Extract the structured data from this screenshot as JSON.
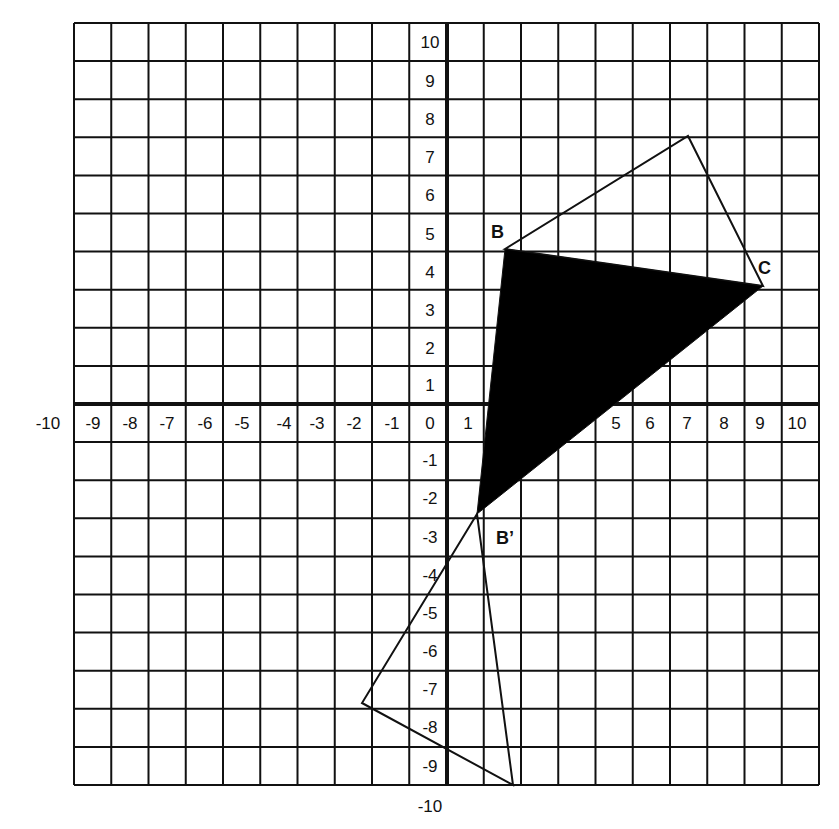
{
  "figure": {
    "type": "coordinate-grid-transformation",
    "background": "#ffffff",
    "line_color": "#111111",
    "fill_color": "#000000"
  },
  "grid": {
    "left_px": 74,
    "top_px": 23,
    "right_px": 819,
    "bottom_px": 785,
    "columns": 20,
    "rows": 20,
    "y_axis_px": 447,
    "x_axis_px": 404
  },
  "x_axis": {
    "ticks": [
      "-10",
      "-9",
      "-8",
      "-7",
      "-6",
      "-5",
      "-4",
      "-3",
      "-2",
      "-1",
      "0",
      "1",
      "5",
      "6",
      "7",
      "8",
      "9",
      "10"
    ],
    "tick_positions_px": [
      48,
      93,
      130,
      167,
      205,
      242,
      284,
      317,
      354,
      392,
      430,
      468,
      616,
      650,
      687,
      724,
      760,
      797
    ]
  },
  "y_axis": {
    "ticks": [
      "10",
      "9",
      "8",
      "7",
      "6",
      "5",
      "4",
      "3",
      "2",
      "1",
      "-1",
      "-2",
      "-3",
      "-4",
      "-5",
      "-6",
      "-7",
      "-8",
      "-9",
      "-10"
    ],
    "tick_positions_px": [
      42,
      81,
      119,
      157,
      195,
      234,
      272,
      310,
      348,
      385,
      460,
      498,
      537,
      575,
      613,
      651,
      689,
      727,
      766,
      806
    ]
  },
  "points": {
    "B": {
      "label": "B",
      "x_px": 505,
      "y_px": 249,
      "label_x": 491,
      "label_y": 238
    },
    "C": {
      "label": "C",
      "x_px": 763,
      "y_px": 286,
      "label_x": 758,
      "label_y": 274
    },
    "B_prime": {
      "label": "B’",
      "x_px": 477,
      "y_px": 514,
      "label_x": 496,
      "label_y": 544
    }
  },
  "shapes": {
    "original_outline": {
      "name": "outlined triangle above (B, top vertex, C)",
      "points_px": [
        [
          505,
          249
        ],
        [
          688,
          136
        ],
        [
          763,
          286
        ]
      ]
    },
    "shaded_triangle": {
      "name": "filled black triangle (B, C, B')",
      "points_px": [
        [
          505,
          249
        ],
        [
          763,
          286
        ],
        [
          477,
          514
        ]
      ]
    },
    "image_outline": {
      "name": "outlined triangle below (B', left vertex, bottom vertex)",
      "points_px": [
        [
          477,
          514
        ],
        [
          362,
          703
        ],
        [
          513,
          785
        ]
      ]
    }
  },
  "chart_data": {
    "type": "diagram",
    "title": "",
    "xlabel": "",
    "ylabel": "",
    "xlim": [
      -10,
      10
    ],
    "ylim": [
      -10,
      10
    ],
    "grid": true,
    "labeled_points": [
      {
        "name": "B",
        "x": 1.5,
        "y": 4
      },
      {
        "name": "C",
        "x": 8.5,
        "y": 3
      },
      {
        "name": "B'",
        "x": 0.75,
        "y": -3
      }
    ],
    "polygons": [
      {
        "name": "outlined triangle (upper)",
        "vertices": [
          [
            1.5,
            4
          ],
          [
            6.5,
            7
          ],
          [
            8.5,
            3
          ]
        ],
        "filled": false
      },
      {
        "name": "shaded triangle",
        "vertices": [
          [
            1.5,
            4
          ],
          [
            8.5,
            3
          ],
          [
            0.75,
            -3
          ]
        ],
        "filled": true
      },
      {
        "name": "outlined triangle (lower)",
        "vertices": [
          [
            0.75,
            -3
          ],
          [
            -2.3,
            -7.9
          ],
          [
            1.8,
            -10
          ]
        ],
        "filled": false
      }
    ]
  }
}
